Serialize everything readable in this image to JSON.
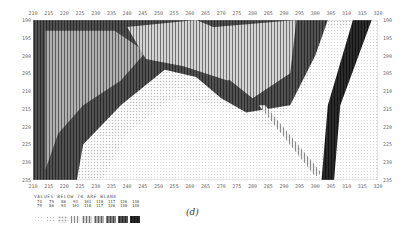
{
  "figure": {
    "caption": "(d)",
    "legend_title": "VALUES BELOW 74 ARE BLANK"
  },
  "chart_data": {
    "type": "heatmap",
    "title": "",
    "subtitle": "",
    "xlabel": "",
    "ylabel": "",
    "x_ticks": [
      210,
      215,
      220,
      225,
      230,
      235,
      240,
      245,
      250,
      255,
      260,
      265,
      270,
      275,
      280,
      285,
      290,
      295,
      300,
      305,
      310,
      315,
      320
    ],
    "y_ticks": [
      190,
      195,
      200,
      205,
      210,
      215,
      220,
      225,
      230,
      235
    ],
    "xlim": [
      210,
      320
    ],
    "ylim": [
      190,
      235
    ],
    "y_axis_inverted": true,
    "grid": false,
    "legend_position": "bottom-left",
    "blank_threshold": 74,
    "legend": [
      {
        "range": "74-79",
        "level": 1
      },
      {
        "range": "79-86",
        "level": 2
      },
      {
        "range": "86-93",
        "level": 3
      },
      {
        "range": "93-101",
        "level": 4
      },
      {
        "range": "101-110",
        "level": 5
      },
      {
        "range": "110-117",
        "level": 6
      },
      {
        "range": "117-126",
        "level": 7
      },
      {
        "range": "126-130",
        "level": 8
      },
      {
        "range": "130-140",
        "level": 9
      }
    ],
    "regions": [
      {
        "name": "background-dark",
        "level": 8,
        "points": [
          [
            210,
            190
          ],
          [
            320,
            190
          ],
          [
            320,
            235
          ],
          [
            210,
            235
          ]
        ]
      },
      {
        "name": "left-mid-band",
        "level": 6,
        "points": [
          [
            214,
            193
          ],
          [
            236,
            193
          ],
          [
            246,
            199
          ],
          [
            238,
            207
          ],
          [
            226,
            214
          ],
          [
            218,
            222
          ],
          [
            214,
            232
          ]
        ]
      },
      {
        "name": "upper-center-band",
        "level": 5,
        "points": [
          [
            240,
            192
          ],
          [
            262,
            190
          ],
          [
            276,
            195
          ],
          [
            282,
            203
          ],
          [
            272,
            207
          ],
          [
            258,
            203
          ],
          [
            246,
            201
          ]
        ]
      },
      {
        "name": "right-upper-band",
        "level": 5,
        "points": [
          [
            268,
            192
          ],
          [
            294,
            190
          ],
          [
            292,
            205
          ],
          [
            280,
            212
          ],
          [
            270,
            205
          ]
        ]
      },
      {
        "name": "light-basin",
        "level": 2,
        "points": [
          [
            224,
            235
          ],
          [
            226,
            225
          ],
          [
            238,
            214
          ],
          [
            252,
            204
          ],
          [
            262,
            206
          ],
          [
            270,
            212
          ],
          [
            278,
            216
          ],
          [
            292,
            214
          ],
          [
            300,
            200
          ],
          [
            304,
            190
          ],
          [
            316,
            190
          ],
          [
            310,
            205
          ],
          [
            305,
            220
          ],
          [
            303,
            235
          ]
        ]
      },
      {
        "name": "basin-core",
        "level": 1,
        "points": [
          [
            232,
            235
          ],
          [
            240,
            222
          ],
          [
            254,
            212
          ],
          [
            270,
            214
          ],
          [
            286,
            220
          ],
          [
            296,
            210
          ],
          [
            304,
            192
          ],
          [
            314,
            191
          ],
          [
            308,
            210
          ],
          [
            302,
            235
          ]
        ]
      },
      {
        "name": "diagonal-streak",
        "level": 4,
        "points": [
          [
            282,
            214
          ],
          [
            284,
            214
          ],
          [
            302,
            233
          ],
          [
            300,
            234
          ]
        ]
      },
      {
        "name": "right-ridge",
        "level": 9,
        "points": [
          [
            312,
            190
          ],
          [
            318,
            190
          ],
          [
            308,
            214
          ],
          [
            306,
            235
          ],
          [
            302,
            235
          ],
          [
            304,
            214
          ]
        ]
      },
      {
        "name": "far-right-light",
        "level": 1,
        "points": [
          [
            318,
            190
          ],
          [
            320,
            190
          ],
          [
            320,
            235
          ],
          [
            306,
            235
          ],
          [
            308,
            214
          ]
        ]
      }
    ]
  }
}
